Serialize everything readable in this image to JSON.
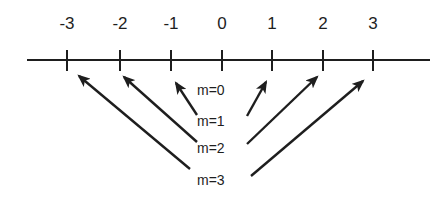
{
  "diagram": {
    "type": "number-line-with-arrows",
    "axis": {
      "ticks": [
        {
          "value": -3,
          "label": "-3",
          "x": 67
        },
        {
          "value": -2,
          "label": "-2",
          "x": 120
        },
        {
          "value": -1,
          "label": "-1",
          "x": 171
        },
        {
          "value": 0,
          "label": "0",
          "x": 222
        },
        {
          "value": 1,
          "label": "1",
          "x": 272
        },
        {
          "value": 2,
          "label": "2",
          "x": 323
        },
        {
          "value": 3,
          "label": "3",
          "x": 373
        }
      ]
    },
    "labels": [
      {
        "text": "m=0",
        "y": 82
      },
      {
        "text": "m=1",
        "y": 113
      },
      {
        "text": "m=2",
        "y": 140
      },
      {
        "text": "m=3",
        "y": 172
      }
    ],
    "arrows": [
      {
        "from": "m=1",
        "to": "-1"
      },
      {
        "from": "m=1",
        "to": "1"
      },
      {
        "from": "m=2",
        "to": "-2"
      },
      {
        "from": "m=2",
        "to": "2"
      },
      {
        "from": "m=3",
        "to": "-3"
      },
      {
        "from": "m=3",
        "to": "3"
      }
    ],
    "colors": {
      "ink": "#1e1e1e",
      "background": "#ffffff"
    }
  }
}
